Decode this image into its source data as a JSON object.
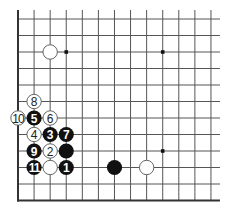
{
  "diagram": {
    "type": "go-board-diagram",
    "board_fragment": {
      "columns": 13,
      "rows": 12,
      "edges_shown": [
        "left",
        "bottom"
      ],
      "open_edges": [
        "top",
        "right"
      ]
    },
    "grid": {
      "origin_x": 18,
      "origin_y": 19,
      "col_spacing": 16.08,
      "row_spacing": 16.5,
      "line_color": "#555555",
      "edge_color": "#333333",
      "line_extend": 9
    },
    "colors": {
      "black_stone": "#111111",
      "white_stone": "#ffffff",
      "white_stone_border": "#555555",
      "label_on_black": "#ffffff",
      "label_on_white": "#222222",
      "star_point": "#111111"
    },
    "star_points": [
      {
        "col": 3,
        "row": 2
      },
      {
        "col": 9,
        "row": 2
      },
      {
        "col": 9,
        "row": 8
      }
    ],
    "stones": [
      {
        "color": "white",
        "col": 2,
        "row": 2,
        "label": ""
      },
      {
        "color": "white",
        "col": 1,
        "row": 5,
        "label": "8"
      },
      {
        "color": "white",
        "col": 0,
        "row": 6,
        "label": "10"
      },
      {
        "color": "black",
        "col": 1,
        "row": 6,
        "label": "5"
      },
      {
        "color": "white",
        "col": 2,
        "row": 6,
        "label": "6"
      },
      {
        "color": "white",
        "col": 1,
        "row": 7,
        "label": "4"
      },
      {
        "color": "black",
        "col": 2,
        "row": 7,
        "label": "3"
      },
      {
        "color": "black",
        "col": 3,
        "row": 7,
        "label": "7"
      },
      {
        "color": "black",
        "col": 1,
        "row": 8,
        "label": "9"
      },
      {
        "color": "white",
        "col": 2,
        "row": 8,
        "label": "2"
      },
      {
        "color": "black",
        "col": 3,
        "row": 8,
        "label": ""
      },
      {
        "color": "black",
        "col": 1,
        "row": 9,
        "label": "11"
      },
      {
        "color": "white",
        "col": 2,
        "row": 9,
        "label": ""
      },
      {
        "color": "black",
        "col": 3,
        "row": 9,
        "label": "1"
      },
      {
        "color": "black",
        "col": 6,
        "row": 9,
        "label": ""
      },
      {
        "color": "white",
        "col": 8,
        "row": 9,
        "label": ""
      }
    ]
  }
}
